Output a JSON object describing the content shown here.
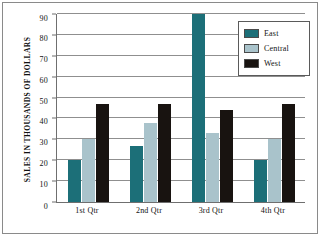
{
  "chart_data": {
    "type": "bar",
    "title": "",
    "xlabel": "",
    "ylabel": "SALES IN THOUSANDS OF DOLLARS",
    "categories": [
      "1st Qtr",
      "2nd Qtr",
      "3rd Qtr",
      "4th Qtr"
    ],
    "series": [
      {
        "name": "East",
        "color": "#1c6f78",
        "values": [
          20,
          27,
          90,
          20
        ]
      },
      {
        "name": "Central",
        "color": "#a9c3cb",
        "values": [
          30,
          38,
          33,
          30
        ]
      },
      {
        "name": "West",
        "color": "#181310",
        "values": [
          47,
          47,
          44,
          47
        ]
      }
    ],
    "ylim": [
      0,
      90
    ],
    "yticks": [
      0,
      10,
      20,
      30,
      40,
      50,
      60,
      70,
      80,
      90
    ],
    "ytick_labels": [
      "0",
      "10",
      "20",
      "30",
      "40",
      "50",
      "60",
      "70",
      "80",
      "90"
    ],
    "grid": true,
    "legend_position": "top-right"
  }
}
